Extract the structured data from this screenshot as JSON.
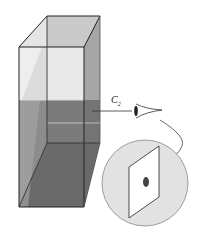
{
  "diagram": {
    "label": {
      "main": "C",
      "sub": "2"
    },
    "colors": {
      "liquid": "#8a8a8a",
      "liquid_dark": "#6e6e6e",
      "glass_light": "#c4c4c4",
      "outline": "#222222",
      "magnifier_bg": "#e2e2e2",
      "spot": "#444444"
    },
    "elements": [
      "glass-column",
      "eye",
      "magnifier-circle",
      "sample-card-with-spot"
    ]
  }
}
